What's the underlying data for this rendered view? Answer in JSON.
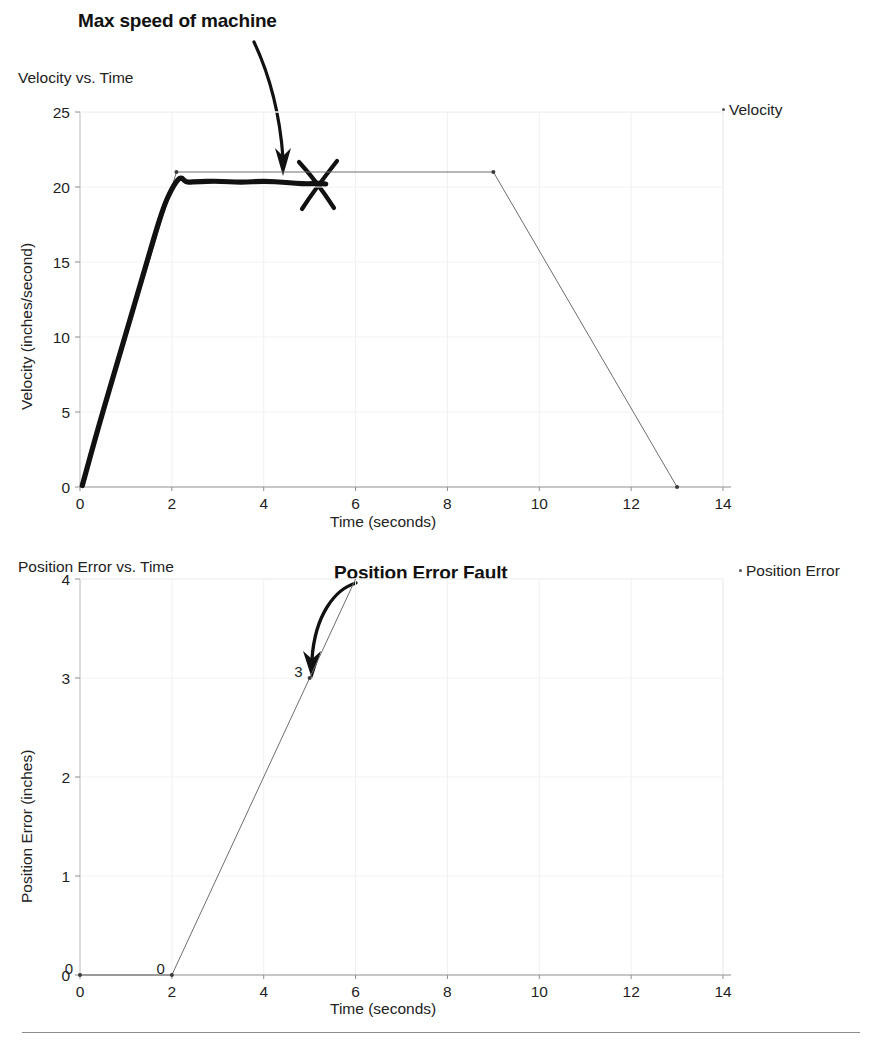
{
  "page": {
    "footer_rule": true
  },
  "annotations": [
    {
      "id": "max-speed",
      "text": "Max speed of machine",
      "style": "bold-marker",
      "points_to": "velocity-plateau"
    },
    {
      "id": "position-error-fault",
      "text": "Position Error Fault",
      "style": "bold-marker",
      "points_to": "position-error-point-3"
    }
  ],
  "charts": [
    {
      "id": "velocity",
      "title": "Velocity vs. Time",
      "xlabel": "Time (seconds)",
      "ylabel": "Velocity (inches/second)",
      "legend": [
        {
          "label": "Velocity",
          "color": "#555555"
        }
      ],
      "handmark": {
        "type": "x-cross",
        "color": "#111111"
      }
    },
    {
      "id": "poserror",
      "title": "Position Error vs. Time",
      "xlabel": "Time (seconds)",
      "ylabel": "Position Error (inches)",
      "legend": [
        {
          "label": "Position Error",
          "color": "#555555"
        }
      ]
    }
  ],
  "chart_data": [
    {
      "id": "velocity",
      "type": "line",
      "title": "Velocity vs. Time",
      "xlabel": "Time (seconds)",
      "ylabel": "Velocity (inches/second)",
      "xlim": [
        0,
        14
      ],
      "ylim": [
        0,
        25
      ],
      "xticks": [
        0,
        2,
        4,
        6,
        8,
        10,
        12,
        14
      ],
      "yticks": [
        0,
        5,
        10,
        15,
        20,
        25
      ],
      "xtick_labels": [
        "0",
        "2",
        "4",
        "6",
        "8",
        "10",
        "12",
        "14"
      ],
      "ytick_labels": [
        "0",
        "5",
        "10",
        "15",
        "20",
        "25"
      ],
      "grid": true,
      "legend_position": "top-right",
      "series": [
        {
          "name": "Velocity",
          "style": "thin-gray-with-markers",
          "color": "#6e6e6e",
          "x": [
            0,
            2.1,
            9.0,
            13.0
          ],
          "y": [
            0,
            21,
            21,
            0
          ],
          "markers_at": [
            [
              2.1,
              21
            ],
            [
              9.0,
              21
            ],
            [
              13.0,
              0
            ]
          ]
        },
        {
          "name": "Measured velocity (hand trace)",
          "style": "thick-black-marker",
          "color": "#111111",
          "x": [
            0.05,
            0.4,
            0.9,
            1.4,
            1.8,
            2.05,
            2.2,
            2.3,
            2.5,
            3.0,
            3.5,
            4.0,
            4.5,
            4.9,
            5.2,
            5.35
          ],
          "y": [
            0.1,
            4.0,
            9.2,
            14.4,
            18.6,
            20.2,
            20.7,
            20.3,
            20.35,
            20.4,
            20.3,
            20.4,
            20.3,
            20.2,
            20.25,
            20.2
          ]
        }
      ],
      "annotations": [
        {
          "text": "Max speed of machine",
          "target_x": 4.7,
          "target_y": 21.6
        },
        {
          "text": "",
          "marker": "x-cross",
          "at_x": 5.4,
          "at_y": 20.0
        }
      ]
    },
    {
      "id": "poserror",
      "type": "line",
      "title": "Position Error vs. Time",
      "xlabel": "Time (seconds)",
      "ylabel": "Position Error (inches)",
      "xlim": [
        0,
        14
      ],
      "ylim": [
        0,
        4
      ],
      "xticks": [
        0,
        2,
        4,
        6,
        8,
        10,
        12,
        14
      ],
      "yticks": [
        0,
        1,
        2,
        3,
        4
      ],
      "xtick_labels": [
        "0",
        "2",
        "4",
        "6",
        "8",
        "10",
        "12",
        "14"
      ],
      "ytick_labels": [
        "0",
        "1",
        "2",
        "3",
        "4"
      ],
      "grid": true,
      "legend_position": "top-right",
      "series": [
        {
          "name": "Position Error",
          "style": "thin-gray-with-markers",
          "color": "#6e6e6e",
          "x": [
            0,
            2.0,
            5.0,
            6.0
          ],
          "y": [
            0,
            0,
            3,
            4
          ],
          "markers_at": [
            [
              0,
              0
            ],
            [
              2.0,
              0
            ],
            [
              5.0,
              3
            ]
          ],
          "data_labels": [
            {
              "x": 0,
              "y": 0,
              "text": "0"
            },
            {
              "x": 2.0,
              "y": 0,
              "text": "0"
            },
            {
              "x": 5.0,
              "y": 3,
              "text": "3"
            }
          ]
        }
      ],
      "annotations": [
        {
          "text": "Position Error Fault",
          "target_x": 5.05,
          "target_y": 3.1
        }
      ]
    }
  ]
}
